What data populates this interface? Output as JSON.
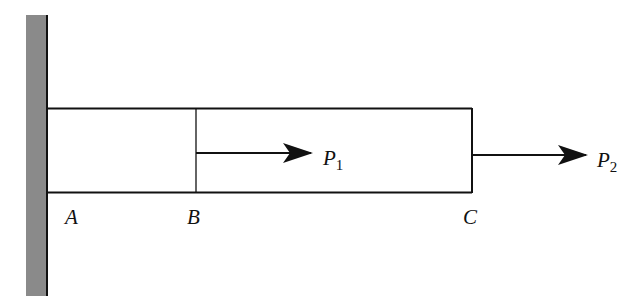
{
  "diagram": {
    "type": "axially loaded bar fixed at wall",
    "colors": {
      "wall": "#8a8a8a",
      "line": "#111111",
      "background": "#ffffff"
    },
    "points": [
      {
        "id": "A",
        "label": "A"
      },
      {
        "id": "B",
        "label": "B"
      },
      {
        "id": "C",
        "label": "C"
      }
    ],
    "loads": [
      {
        "id": "P1",
        "symbol": "P",
        "subscript": "1",
        "applied_at": "B",
        "direction": "right"
      },
      {
        "id": "P2",
        "symbol": "P",
        "subscript": "2",
        "applied_at": "C",
        "direction": "right"
      }
    ]
  }
}
